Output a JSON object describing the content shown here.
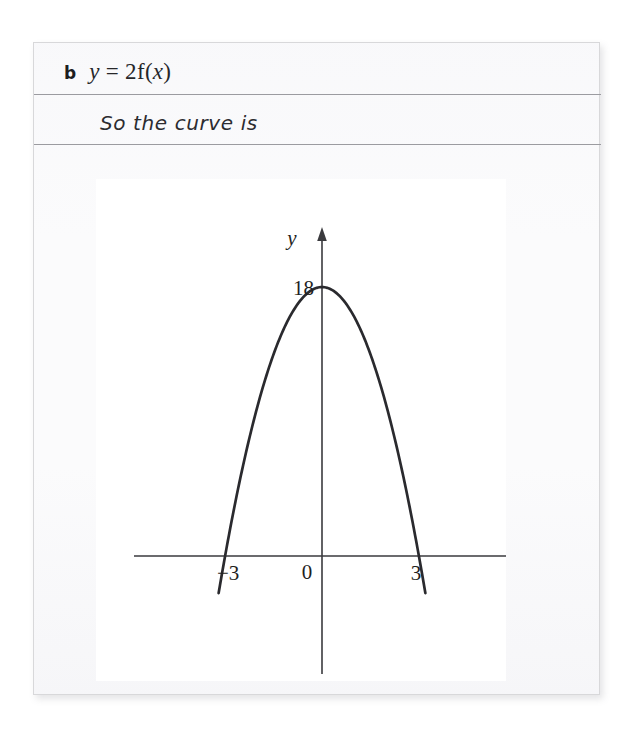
{
  "worksheet": {
    "part_label": "b",
    "equation": {
      "lhs": "y",
      "equals": "=",
      "coefficient": "2",
      "function_name": "f",
      "open_paren": "(",
      "variable": "x",
      "close_paren": ")",
      "full_text": "y = 2f(x)"
    },
    "conclusion_text": "So the curve is"
  },
  "chart_data": {
    "type": "line",
    "title": "",
    "subtitle": "",
    "xlabel": "x",
    "ylabel": "y",
    "curve_label": "y = 2f(x)",
    "function": "y = -2x^2 + 18",
    "vertex": {
      "x": 0,
      "y": 18,
      "label": "18"
    },
    "roots": [
      -3,
      3
    ],
    "x": [
      -3.2,
      -3.0,
      -2.5,
      -2.0,
      -1.5,
      -1.0,
      -0.5,
      0.0,
      0.5,
      1.0,
      1.5,
      2.0,
      2.5,
      3.0,
      3.2
    ],
    "y": [
      -2.48,
      0,
      5.5,
      10,
      13.5,
      16,
      17.5,
      18,
      17.5,
      16,
      13.5,
      10,
      5.5,
      0,
      -2.48
    ],
    "xlim": [
      -3.6,
      4.6
    ],
    "ylim": [
      -5.2,
      19.6
    ],
    "grid": false,
    "legend": false,
    "axis_arrows": {
      "x": "right",
      "y": "up"
    },
    "x_tick_labels": [
      "-3",
      "0",
      "3"
    ],
    "x_tick_values": [
      -3,
      0,
      3
    ],
    "y_tick_labels": [
      "18"
    ],
    "y_tick_values": [
      18
    ],
    "origin_label": "0",
    "curve_color": "#2a2a2e",
    "axis_color": "#3a3a3e",
    "panel_background": "#ffffff"
  },
  "labels": {
    "x_axis_name": "x",
    "y_axis_name": "y",
    "y_vertex_value": "18",
    "x_tick_neg3": "−3",
    "x_tick_zero": "0",
    "x_tick_pos3": "3"
  }
}
